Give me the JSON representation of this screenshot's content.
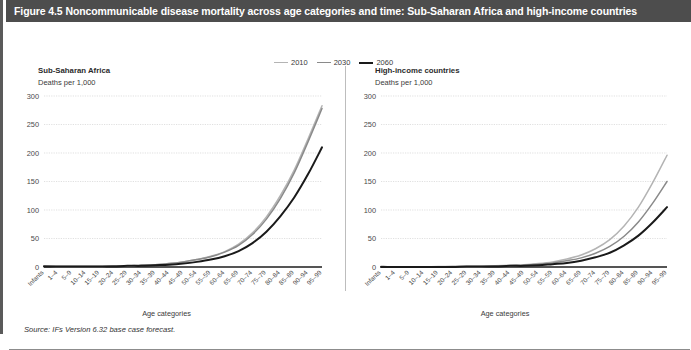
{
  "figure": {
    "title": "Figure 4.5 Noncommunicable disease mortality across age categories and time: Sub-Saharan Africa and high-income countries",
    "source": "Source: IFs Version 6.32 base case forecast.",
    "title_bar_color": "#4d4d4d",
    "title_text_color": "#ffffff"
  },
  "legend": {
    "position": "top-center",
    "entries": [
      {
        "label": "2010",
        "color": "#b4b4b4"
      },
      {
        "label": "2030",
        "color": "#8a8a8a"
      },
      {
        "label": "2060",
        "color": "#1a1a1a"
      }
    ]
  },
  "chart_data": [
    {
      "type": "line",
      "title": "Sub-Saharan Africa",
      "subtitle": "Deaths per 1,000",
      "ylabel": "Deaths per 1,000",
      "xlabel": "Age categories",
      "ylim": [
        0,
        300
      ],
      "yticks": [
        0,
        50,
        100,
        150,
        200,
        250,
        300
      ],
      "grid": true,
      "legend_position": "shared-top",
      "categories": [
        "Infants",
        "1–4",
        "5–9",
        "10–14",
        "15–19",
        "20–24",
        "25–29",
        "30–34",
        "35–39",
        "40–44",
        "45–49",
        "50–54",
        "55–59",
        "60–64",
        "65–69",
        "70–74",
        "75–79",
        "80–84",
        "85–89",
        "90–94",
        "95–99"
      ],
      "series": [
        {
          "name": "2010",
          "color": "#b4b4b4",
          "values": [
            2,
            1,
            1,
            1,
            1,
            2,
            2,
            3,
            4,
            6,
            9,
            13,
            19,
            27,
            40,
            60,
            88,
            125,
            170,
            225,
            283
          ]
        },
        {
          "name": "2030",
          "color": "#8a8a8a",
          "values": [
            2,
            1,
            1,
            1,
            1,
            2,
            2,
            3,
            4,
            6,
            9,
            13,
            18,
            26,
            38,
            57,
            84,
            120,
            165,
            220,
            278
          ]
        },
        {
          "name": "2060",
          "color": "#1a1a1a",
          "values": [
            1,
            1,
            1,
            1,
            1,
            1,
            2,
            2,
            3,
            4,
            6,
            9,
            13,
            19,
            28,
            42,
            62,
            89,
            122,
            163,
            210
          ]
        }
      ]
    },
    {
      "type": "line",
      "title": "High-income countries",
      "subtitle": "Deaths per 1,000",
      "ylabel": "Deaths per 1,000",
      "xlabel": "Age categories",
      "ylim": [
        0,
        300
      ],
      "yticks": [
        0,
        50,
        100,
        150,
        200,
        250,
        300
      ],
      "grid": true,
      "legend_position": "shared-top",
      "categories": [
        "Infants",
        "1–4",
        "5–9",
        "10–14",
        "15–19",
        "20–24",
        "25–29",
        "30–34",
        "35–39",
        "40–44",
        "45–49",
        "50–54",
        "55–59",
        "60–64",
        "65–69",
        "70–74",
        "75–79",
        "80–84",
        "85–89",
        "90–94",
        "95–99"
      ],
      "series": [
        {
          "name": "2010",
          "color": "#b4b4b4",
          "values": [
            1,
            0,
            0,
            0,
            1,
            1,
            1,
            1,
            2,
            3,
            4,
            6,
            9,
            14,
            21,
            32,
            48,
            72,
            105,
            148,
            196
          ]
        },
        {
          "name": "2030",
          "color": "#8a8a8a",
          "values": [
            1,
            0,
            0,
            0,
            0,
            1,
            1,
            1,
            2,
            2,
            3,
            5,
            7,
            11,
            16,
            24,
            36,
            54,
            79,
            112,
            150
          ]
        },
        {
          "name": "2060",
          "color": "#1a1a1a",
          "values": [
            0,
            0,
            0,
            0,
            0,
            0,
            1,
            1,
            1,
            2,
            2,
            3,
            5,
            7,
            11,
            17,
            25,
            38,
            55,
            78,
            105
          ]
        }
      ]
    }
  ]
}
